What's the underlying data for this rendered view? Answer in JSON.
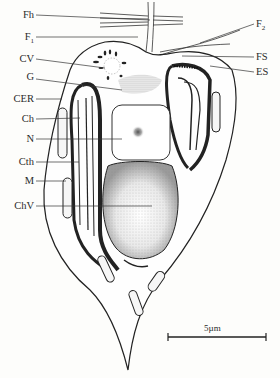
{
  "diagram": {
    "type": "cell-ultrastructure-schematic",
    "left_labels": [
      {
        "key": "Fh",
        "text": "Fh",
        "y": 15,
        "target": [
          150,
          20
        ]
      },
      {
        "key": "F1",
        "text": "F",
        "sub": "1",
        "y": 37,
        "target": [
          138,
          37
        ]
      },
      {
        "key": "CV",
        "text": "CV",
        "y": 59,
        "target": [
          105,
          68
        ]
      },
      {
        "key": "G",
        "text": "G",
        "y": 77,
        "target": [
          122,
          90
        ]
      },
      {
        "key": "CER",
        "text": "CER",
        "y": 99,
        "target": [
          62,
          99
        ]
      },
      {
        "key": "Ch",
        "text": "Ch",
        "y": 119,
        "target": [
          80,
          118
        ]
      },
      {
        "key": "N",
        "text": "N",
        "y": 139,
        "target": [
          122,
          139
        ]
      },
      {
        "key": "Cth",
        "text": "Cth",
        "y": 162,
        "target": [
          79,
          162
        ]
      },
      {
        "key": "M",
        "text": "M",
        "y": 181,
        "target": [
          66,
          181
        ]
      },
      {
        "key": "ChV",
        "text": "ChV",
        "y": 206,
        "target": [
          152,
          206
        ]
      }
    ],
    "right_labels": [
      {
        "key": "F2",
        "text": "F",
        "sub": "2",
        "y": 24,
        "target": [
          200,
          43
        ]
      },
      {
        "key": "FS",
        "text": "FS",
        "y": 57,
        "target": [
          182,
          56
        ]
      },
      {
        "key": "ES",
        "text": "ES",
        "y": 72,
        "target": [
          210,
          66
        ]
      }
    ],
    "scale_bar": {
      "label": "5µm",
      "x1": 168,
      "x2": 266,
      "y": 337
    },
    "colors": {
      "ink": "#2a2a2a",
      "stipple": "#8a8a8a",
      "paper": "#fdfdfb"
    }
  }
}
